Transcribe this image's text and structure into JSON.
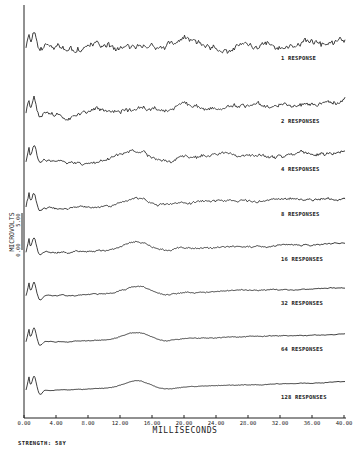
{
  "chart_data": {
    "type": "line",
    "title": "",
    "xlabel": "MILLISECONDS",
    "ylabel": "MICROVOLTS",
    "y_scale_marks": [
      "0.00",
      "5.00"
    ],
    "xlim": [
      0,
      40
    ],
    "x_ticks": [
      "0.00",
      "4.00",
      "8.00",
      "12.00",
      "16.00",
      "20.00",
      "24.00",
      "28.00",
      "32.00",
      "36.00",
      "40.00"
    ],
    "grid": false,
    "legend_position": "inline-right",
    "note": "Stacked averaged evoked-response traces. Series values are approximate, procedurally generated shapes tuned by eye to resemble each trace; they are not data points read from the image.",
    "series": [
      {
        "name": "1 RESPONSE",
        "label": "1 RESPONSE",
        "responses": 1,
        "baseline_px": 50,
        "noise": 3.2,
        "bump": 6,
        "trend": 8,
        "seed": 11
      },
      {
        "name": "2 RESPONSES",
        "label": "2 RESPONSES",
        "responses": 2,
        "baseline_px": 114,
        "noise": 2.4,
        "bump": 6,
        "trend": 10,
        "seed": 23
      },
      {
        "name": "4 RESPONSES",
        "label": "4 RESPONSES",
        "responses": 4,
        "baseline_px": 162,
        "noise": 1.8,
        "bump": 7,
        "trend": 10,
        "seed": 37
      },
      {
        "name": "8 RESPONSES",
        "label": "8 RESPONSES",
        "responses": 8,
        "baseline_px": 207,
        "noise": 1.3,
        "bump": 7,
        "trend": 9,
        "seed": 41
      },
      {
        "name": "16 RESPONSES",
        "label": "16 RESPONSES",
        "responses": 16,
        "baseline_px": 252,
        "noise": 0.9,
        "bump": 7,
        "trend": 8,
        "seed": 53
      },
      {
        "name": "32 RESPONSES",
        "label": "32 RESPONSES",
        "responses": 32,
        "baseline_px": 296,
        "noise": 0.6,
        "bump": 7,
        "trend": 8,
        "seed": 67
      },
      {
        "name": "64 RESPONSES",
        "label": "64 RESPONSES",
        "responses": 64,
        "baseline_px": 342,
        "noise": 0.4,
        "bump": 7,
        "trend": 8,
        "seed": 71
      },
      {
        "name": "128 RESPONSES",
        "label": "128 RESPONSES",
        "responses": 128,
        "baseline_px": 390,
        "noise": 0.3,
        "bump": 7,
        "trend": 8,
        "seed": 89
      }
    ]
  },
  "footer": {
    "strength": "STRENGTH:  58Y"
  }
}
